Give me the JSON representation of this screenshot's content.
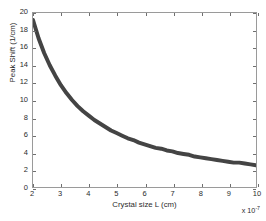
{
  "chart_data": {
    "type": "line",
    "title": "",
    "xlabel": "Crystal size L (cm)",
    "ylabel": "Peak Shift (1/cm)",
    "x_exponent_base": "x 10",
    "x_exponent_power": "-7",
    "xlim": [
      2,
      10
    ],
    "ylim": [
      0,
      20
    ],
    "grid": false,
    "legend": null,
    "xticks": [
      2,
      3,
      4,
      5,
      6,
      7,
      8,
      9,
      10
    ],
    "xtick_labels": [
      "2",
      "3",
      "4",
      "5",
      "6",
      "7",
      "8",
      "9",
      "10"
    ],
    "yticks": [
      0,
      2,
      4,
      6,
      8,
      10,
      12,
      14,
      16,
      18,
      20
    ],
    "ytick_labels": [
      "0",
      "2",
      "4",
      "6",
      "8",
      "10",
      "12",
      "14",
      "16",
      "18",
      "20"
    ],
    "series": [
      {
        "name": "Peak Shift",
        "color": "#444444",
        "line_width_px": 4,
        "relationship": "inverse (y ~ 38.5 / x, x in 1e-7 cm)",
        "x": [
          2.0,
          2.2,
          2.4,
          2.6,
          2.8,
          3.0,
          3.2,
          3.4,
          3.6,
          3.8,
          4.0,
          4.2,
          4.4,
          4.6,
          4.8,
          5.0,
          5.2,
          5.4,
          5.6,
          5.8,
          6.0,
          6.2,
          6.4,
          6.6,
          6.8,
          7.0,
          7.2,
          7.4,
          7.6,
          7.8,
          8.0,
          8.2,
          8.4,
          8.6,
          8.8,
          9.0,
          9.2,
          9.4,
          9.6,
          9.8,
          10.0
        ],
        "y": [
          19.2,
          17.1,
          15.4,
          14.0,
          12.8,
          11.7,
          10.8,
          10.0,
          9.3,
          8.7,
          8.2,
          7.7,
          7.3,
          6.9,
          6.5,
          6.2,
          5.9,
          5.6,
          5.4,
          5.1,
          4.9,
          4.7,
          4.5,
          4.4,
          4.2,
          4.1,
          3.9,
          3.8,
          3.7,
          3.5,
          3.4,
          3.3,
          3.2,
          3.1,
          3.0,
          2.9,
          2.8,
          2.8,
          2.7,
          2.6,
          2.5
        ]
      }
    ],
    "axes_color": "#9a9a9a",
    "background_color": "#ffffff"
  }
}
